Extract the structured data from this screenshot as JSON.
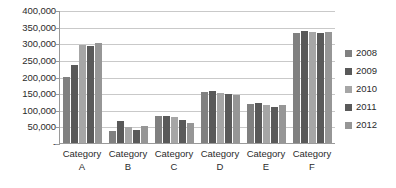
{
  "chart_data": {
    "type": "bar",
    "title": "",
    "subtitle": "",
    "xlabel": "",
    "ylabel": "",
    "categories": [
      "Category A",
      "Category B",
      "Category C",
      "Category D",
      "Category E",
      "Category F"
    ],
    "category_lines": [
      [
        "Category",
        "A"
      ],
      [
        "Category",
        "B"
      ],
      [
        "Category",
        "C"
      ],
      [
        "Category",
        "D"
      ],
      [
        "Category",
        "E"
      ],
      [
        "Category",
        "F"
      ]
    ],
    "series": [
      {
        "name": "2008",
        "color": "#808080",
        "values": [
          198000,
          37000,
          81000,
          153000,
          117000,
          331000
        ]
      },
      {
        "name": "2009",
        "color": "#595959",
        "values": [
          235000,
          65000,
          81000,
          157000,
          119000,
          338000
        ]
      },
      {
        "name": "2010",
        "color": "#a6a6a6",
        "values": [
          295000,
          48000,
          78000,
          149000,
          113000,
          334000
        ]
      },
      {
        "name": "2011",
        "color": "#5a5a5a",
        "values": [
          291000,
          40000,
          68000,
          146000,
          109000,
          332000
        ]
      },
      {
        "name": "2012",
        "color": "#969696",
        "values": [
          302000,
          50000,
          61000,
          143000,
          113000,
          334000
        ]
      }
    ],
    "ylim": [
      0,
      400000
    ],
    "ytick_values": [
      400000,
      350000,
      300000,
      250000,
      200000,
      150000,
      100000,
      50000,
      0
    ],
    "ytick_labels": [
      "400,000",
      "350,000",
      "300,000",
      "250,000",
      "200,000",
      "150,000",
      "100,000",
      "50,000",
      "-"
    ],
    "grid": true,
    "grid_axis": "y",
    "legend_position": "right",
    "legend_entries": [
      "2008",
      "2009",
      "2010",
      "2011",
      "2012"
    ],
    "annotations": [],
    "background_color": "#ffffff",
    "gridline_color": "#c9c9c9",
    "axis_color": "#9a9a9a",
    "text_color": "#2b2b2b"
  }
}
